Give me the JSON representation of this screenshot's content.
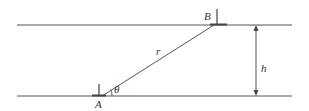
{
  "diagram": {
    "type": "geometry",
    "labels": {
      "point_a": "A",
      "point_b": "B",
      "distance": "r",
      "height": "h",
      "angle": "θ"
    },
    "colors": {
      "line": "#444444",
      "text": "#333333"
    }
  }
}
